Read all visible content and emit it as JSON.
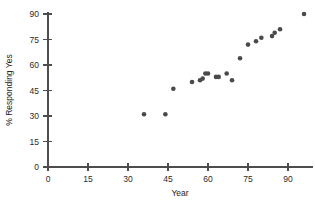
{
  "chart_data": {
    "type": "scatter",
    "title": "",
    "xlabel": "Year",
    "ylabel": "% Responding Yes",
    "xlim": [
      0,
      100
    ],
    "ylim": [
      0,
      95
    ],
    "xticks": [
      0,
      15,
      30,
      45,
      60,
      75,
      90
    ],
    "yticks": [
      0,
      15,
      30,
      45,
      60,
      75,
      90
    ],
    "grid": false,
    "legend": null,
    "marker_color": "#4a4a4a",
    "marker_size": 4.6,
    "points": [
      {
        "x": 36,
        "y": 31
      },
      {
        "x": 44,
        "y": 31
      },
      {
        "x": 47,
        "y": 46
      },
      {
        "x": 54,
        "y": 50
      },
      {
        "x": 57,
        "y": 51
      },
      {
        "x": 58,
        "y": 52
      },
      {
        "x": 59,
        "y": 55
      },
      {
        "x": 60,
        "y": 55
      },
      {
        "x": 63,
        "y": 53
      },
      {
        "x": 64,
        "y": 53
      },
      {
        "x": 67,
        "y": 55
      },
      {
        "x": 69,
        "y": 51
      },
      {
        "x": 72,
        "y": 64
      },
      {
        "x": 75,
        "y": 72
      },
      {
        "x": 78,
        "y": 74
      },
      {
        "x": 80,
        "y": 76
      },
      {
        "x": 84,
        "y": 77
      },
      {
        "x": 85,
        "y": 79
      },
      {
        "x": 87,
        "y": 81
      },
      {
        "x": 96,
        "y": 90
      }
    ]
  },
  "axes": {
    "x_tick_labels": [
      "0",
      "15",
      "30",
      "45",
      "60",
      "75",
      "90"
    ],
    "y_tick_labels": [
      "0",
      "15",
      "30",
      "45",
      "60",
      "75",
      "90"
    ],
    "x_title": "Year",
    "y_title": "% Responding Yes"
  },
  "top_caption": ""
}
